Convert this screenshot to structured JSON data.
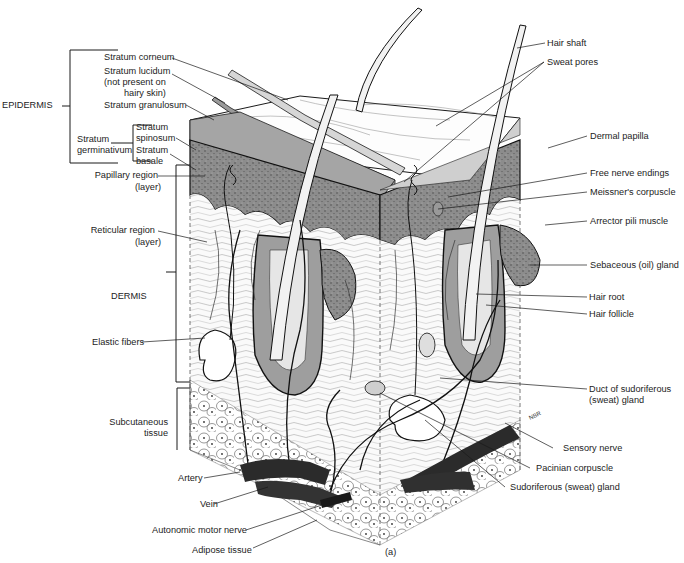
{
  "figure": {
    "panel_label": "(a)",
    "artist_initials": "NBR"
  },
  "left_labels": {
    "epidermis": "EPIDERMIS",
    "stratum_corneum": "Stratum corneum",
    "stratum_lucidum_1": "Stratum lucidum",
    "stratum_lucidum_2": "(not present on",
    "stratum_lucidum_3": "hairy skin)",
    "stratum_granulosum": "Stratum granulosum",
    "stratum_germinativum_1": "Stratum",
    "stratum_germinativum_2": "germinativum",
    "stratum_spinosum_1": "Stratum",
    "stratum_spinosum_2": "spinosum",
    "stratum_basale_1": "Stratum",
    "stratum_basale_2": "basale",
    "papillary_1": "Papillary region",
    "papillary_2": "(layer)",
    "reticular_1": "Reticular region",
    "reticular_2": "(layer)",
    "dermis": "DERMIS",
    "elastic_fibers": "Elastic fibers",
    "subcutaneous_1": "Subcutaneous",
    "subcutaneous_2": "tissue",
    "artery": "Artery",
    "vein": "Vein",
    "autonomic_motor_nerve": "Autonomic motor nerve",
    "adipose_tissue": "Adipose tissue"
  },
  "right_labels": {
    "hair_shaft": "Hair shaft",
    "sweat_pores": "Sweat pores",
    "dermal_papilla": "Dermal papilla",
    "free_nerve_endings": "Free nerve endings",
    "meissners_corpuscle": "Meissner's corpuscle",
    "arrector_pili_muscle": "Arrector pili muscle",
    "sebaceous_gland": "Sebaceous (oil) gland",
    "hair_root": "Hair root",
    "hair_follicle": "Hair follicle",
    "duct_sudoriferous_1": "Duct of sudoriferous",
    "duct_sudoriferous_2": "(sweat) gland",
    "sensory_nerve": "Sensory nerve",
    "pacinian_corpuscle": "Pacinian corpuscle",
    "sudoriferous_gland": "Sudoriferous (sweat) gland"
  },
  "colors": {
    "ink": "#1a1a1a",
    "epidermis_fill": "#8a8a8a",
    "granulosum_fill": "#a9a9a9",
    "dermis_fill": "#f4f4f4",
    "vessel_fill": "#2b2b2b",
    "background": "#ffffff"
  }
}
